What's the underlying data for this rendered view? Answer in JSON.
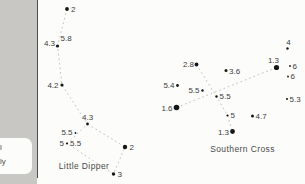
{
  "page": {
    "margin": {
      "fragments": {
        "line1": "l",
        "line2": "ly"
      }
    },
    "colors": {
      "page_gray": "#c8c7c3",
      "chart_bg": "#fcfcfb",
      "rule": "#4f4f4f",
      "star": "#161616",
      "dashed_line": "#bdbdbd",
      "label": "#3c3c3c"
    }
  },
  "star_map": {
    "description": "Constellation magnitude chart showing Little Dipper and Southern Cross with stellar magnitude labels",
    "constellations": [
      {
        "name": "Little Dipper",
        "name_x": 84,
        "name_y": 169,
        "lines": [
          [
            [
              67,
              9
            ],
            [
              57.5,
              46
            ],
            [
              62,
              85
            ],
            [
              87.5,
              124
            ],
            [
              125,
              147
            ],
            [
              113.5,
              174
            ],
            [
              67,
              143.5
            ],
            [
              87.5,
              124
            ]
          ]
        ],
        "stars": [
          {
            "mag": "2",
            "x": 67,
            "y": 9,
            "r": 1.9,
            "lx": 71,
            "ly": 12,
            "anchor": "start"
          },
          {
            "mag": "4.3",
            "x": 57.5,
            "y": 46,
            "r": 1.6,
            "lx": 55,
            "ly": 45.5,
            "anchor": "end"
          },
          {
            "mag": "5.8",
            "x": 0,
            "y": 0,
            "r": 0,
            "lx": 60.5,
            "ly": 41,
            "anchor": "start"
          },
          {
            "mag": "4.2",
            "x": 62,
            "y": 85,
            "r": 1.6,
            "lx": 58.5,
            "ly": 87.5,
            "anchor": "end"
          },
          {
            "mag": "4.3",
            "x": 87.5,
            "y": 124,
            "r": 1.4,
            "lx": 82,
            "ly": 120,
            "anchor": "start"
          },
          {
            "mag": "5.5",
            "x": 75.5,
            "y": 133,
            "r": 0.9,
            "lx": 72.5,
            "ly": 134.5,
            "anchor": "end"
          },
          {
            "mag": "5",
            "x": 67,
            "y": 143.5,
            "r": 1.1,
            "lx": 64,
            "ly": 146,
            "anchor": "end"
          },
          {
            "mag": "5.5",
            "x": 0,
            "y": 0,
            "r": 0,
            "lx": 70,
            "ly": 146,
            "anchor": "start"
          },
          {
            "mag": "2",
            "x": 125,
            "y": 147,
            "r": 2.2,
            "lx": 129.5,
            "ly": 149.5,
            "anchor": "start"
          },
          {
            "mag": "3",
            "x": 113.5,
            "y": 174,
            "r": 1.7,
            "lx": 117.5,
            "ly": 176.5,
            "anchor": "start"
          }
        ]
      },
      {
        "name": "Southern Cross",
        "name_x": 242.5,
        "name_y": 152,
        "lines": [
          [
            [
              196.5,
              64.5
            ],
            [
              216.5,
              96.5
            ],
            [
              227.5,
              115.5
            ],
            [
              232.5,
              131.5
            ]
          ],
          [
            [
              176.5,
              107.5
            ],
            [
              276.5,
              67.5
            ]
          ]
        ],
        "stars": [
          {
            "mag": "2.8",
            "x": 196.5,
            "y": 64.5,
            "r": 1.9,
            "lx": 194,
            "ly": 66.5,
            "anchor": "end"
          },
          {
            "mag": "3.6",
            "x": 226,
            "y": 70.5,
            "r": 1.5,
            "lx": 229,
            "ly": 73.5,
            "anchor": "start"
          },
          {
            "mag": "1.3",
            "x": 276.5,
            "y": 67.5,
            "r": 2.6,
            "lx": 279,
            "ly": 63,
            "anchor": "end"
          },
          {
            "mag": "4",
            "x": 287.5,
            "y": 48.5,
            "r": 1.2,
            "lx": 288.5,
            "ly": 44.5,
            "anchor": "middle"
          },
          {
            "mag": "6",
            "x": 290,
            "y": 66,
            "r": 0.9,
            "lx": 292.5,
            "ly": 68.5,
            "anchor": "start"
          },
          {
            "mag": "6",
            "x": 288,
            "y": 76.5,
            "r": 0.9,
            "lx": 290.5,
            "ly": 79,
            "anchor": "start"
          },
          {
            "mag": "5.4",
            "x": 177.5,
            "y": 85.5,
            "r": 1.4,
            "lx": 174.5,
            "ly": 87.5,
            "anchor": "end"
          },
          {
            "mag": "5.5",
            "x": 202.5,
            "y": 90.5,
            "r": 1.2,
            "lx": 199.5,
            "ly": 92.5,
            "anchor": "end"
          },
          {
            "mag": "5.5",
            "x": 216.5,
            "y": 96.5,
            "r": 1.2,
            "lx": 219.5,
            "ly": 99,
            "anchor": "start"
          },
          {
            "mag": "1.6",
            "x": 176.5,
            "y": 107.5,
            "r": 2.8,
            "lx": 172.5,
            "ly": 110.5,
            "anchor": "end"
          },
          {
            "mag": "5.3",
            "x": 287,
            "y": 99,
            "r": 1,
            "lx": 289.5,
            "ly": 101.5,
            "anchor": "start"
          },
          {
            "mag": "5",
            "x": 227.5,
            "y": 115.5,
            "r": 1.1,
            "lx": 230.5,
            "ly": 118,
            "anchor": "start"
          },
          {
            "mag": "4.7",
            "x": 252.5,
            "y": 116,
            "r": 1.5,
            "lx": 255.5,
            "ly": 118.5,
            "anchor": "start"
          },
          {
            "mag": "1.3",
            "x": 232.5,
            "y": 131.5,
            "r": 2.4,
            "lx": 229,
            "ly": 134.5,
            "anchor": "end"
          }
        ]
      }
    ]
  }
}
